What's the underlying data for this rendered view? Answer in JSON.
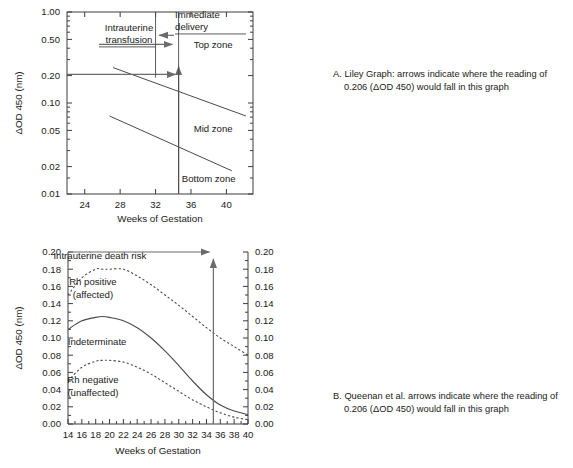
{
  "figure": {
    "panel_a_id": "A",
    "panel_b_id": "B"
  },
  "captions": {
    "a_label": "A.",
    "a_text": "Liley Graph: arrows indicate where the reading of 0.206 (ΔOD 450) would fall in this graph",
    "b_label": "B.",
    "b_text": "Queenan et al. arrows indicate where the reading of 0.206 (ΔOD 450) would fall in this graph"
  },
  "chart_data": [
    {
      "type": "line",
      "id": "liley-graph",
      "title": "",
      "xlabel": "Weeks of Gestation",
      "ylabel": "ΔOD 450 (nm)",
      "yscale": "log",
      "xlim": [
        22,
        43
      ],
      "ylim": [
        0.01,
        1.0
      ],
      "xticks": [
        24,
        28,
        32,
        36,
        40
      ],
      "yticks": [
        1.0,
        0.5,
        0.2,
        0.1,
        0.05,
        0.02,
        0.01
      ],
      "ytick_labels": [
        "1.00",
        "0.50",
        "0.20",
        "0.10",
        "0.05",
        "0.02",
        "0.01"
      ],
      "grid": false,
      "legend": "none",
      "series": [
        {
          "name": "Top zone boundary",
          "x": [
            27.2,
            42.2
          ],
          "y": [
            0.245,
            0.072
          ]
        },
        {
          "name": "Mid zone boundary",
          "x": [
            26.8,
            40.6
          ],
          "y": [
            0.072,
            0.018
          ]
        }
      ],
      "zone_labels": [
        {
          "text": "Top zone",
          "x": 38.5,
          "y": 0.4
        },
        {
          "text": "Mid zone",
          "x": 38.5,
          "y": 0.048
        },
        {
          "text": "Bottom zone",
          "x": 38.0,
          "y": 0.0135
        }
      ],
      "annotations": [
        {
          "text": "Intrauterine transfusion",
          "x": 29.0,
          "y": 0.62
        },
        {
          "text": "Immediate delivery",
          "x": 34.2,
          "y": 0.86
        },
        {
          "text": "reading_value",
          "value": 0.206,
          "week": 34.6
        }
      ]
    },
    {
      "type": "line",
      "id": "queenan-graph",
      "title": "",
      "xlabel": "Weeks of Gestation",
      "ylabel": "ΔOD 450 (nm)",
      "yscale": "linear",
      "xlim": [
        14,
        40
      ],
      "ylim": [
        0.0,
        0.2
      ],
      "xticks": [
        14,
        16,
        18,
        20,
        22,
        24,
        26,
        28,
        30,
        32,
        34,
        36,
        38,
        40
      ],
      "yticks": [
        0.0,
        0.02,
        0.04,
        0.06,
        0.08,
        0.1,
        0.12,
        0.14,
        0.16,
        0.18,
        0.2
      ],
      "ytick_labels": [
        "0.00",
        "0.02",
        "0.04",
        "0.06",
        "0.08",
        "0.10",
        "0.12",
        "0.14",
        "0.16",
        "0.18",
        "0.20"
      ],
      "right_axis": true,
      "grid": false,
      "legend": "inline-labels",
      "series": [
        {
          "name": "Rh positive (affected) upper boundary",
          "style": "dashed",
          "x": [
            14,
            16,
            18,
            19,
            20,
            22,
            24,
            26,
            28,
            30,
            32,
            34,
            36,
            38,
            40
          ],
          "y": [
            0.15,
            0.17,
            0.18,
            0.18,
            0.18,
            0.18,
            0.172,
            0.162,
            0.15,
            0.138,
            0.125,
            0.112,
            0.1,
            0.09,
            0.08
          ]
        },
        {
          "name": "Indeterminate upper boundary",
          "style": "solid",
          "x": [
            14,
            16,
            18,
            19,
            20,
            22,
            24,
            26,
            28,
            30,
            32,
            34,
            36,
            38,
            40
          ],
          "y": [
            0.11,
            0.12,
            0.124,
            0.125,
            0.124,
            0.12,
            0.112,
            0.1,
            0.085,
            0.068,
            0.05,
            0.034,
            0.022,
            0.015,
            0.011
          ]
        },
        {
          "name": "Rh negative (unaffected) boundary",
          "style": "dashed",
          "x": [
            14,
            16,
            18,
            19,
            20,
            22,
            24,
            26,
            28,
            30,
            32,
            34,
            36,
            38,
            40
          ],
          "y": [
            0.05,
            0.066,
            0.073,
            0.074,
            0.074,
            0.072,
            0.066,
            0.058,
            0.048,
            0.038,
            0.028,
            0.02,
            0.013,
            0.008,
            0.005
          ]
        }
      ],
      "zone_labels": [
        {
          "text": "Intrauterine death risk",
          "x": 18.6,
          "y": 0.192
        },
        {
          "text": "Rh positive",
          "x": 17.6,
          "y": 0.162
        },
        {
          "text": "(affected)",
          "x": 17.6,
          "y": 0.147
        },
        {
          "text": "Indeterminate",
          "x": 18.2,
          "y": 0.092
        },
        {
          "text": "Rh negative",
          "x": 17.6,
          "y": 0.048
        },
        {
          "text": "(unaffected)",
          "x": 17.6,
          "y": 0.033
        }
      ],
      "annotations": [
        {
          "text": "reading_value",
          "value": 0.206,
          "week": 35.0
        }
      ]
    }
  ]
}
